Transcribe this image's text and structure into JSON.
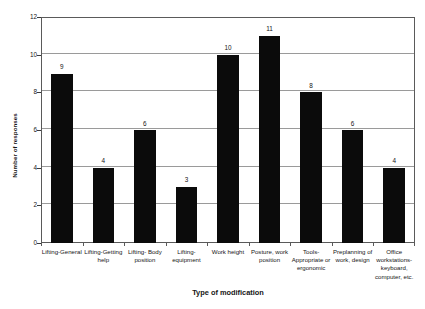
{
  "chart_data": {
    "type": "bar",
    "title": "",
    "xlabel": "Type of modification",
    "ylabel": "Number of responses",
    "ylim": [
      0,
      12
    ],
    "yticks": [
      0,
      2,
      4,
      6,
      8,
      10,
      12
    ],
    "grid": true,
    "legend": false,
    "bar_color": "#0b0b0b",
    "categories": [
      "Lifting-General",
      "Lifting-Getting help",
      "Lifting- Body position",
      "Lifting-equipment",
      "Work height",
      "Posture, work position",
      "Tools-Appropriate or ergonomic",
      "Preplanning of work, design",
      "Office workstations-keyboard, computer, etc."
    ],
    "values": [
      9,
      4,
      6,
      3,
      10,
      11,
      8,
      6,
      4
    ],
    "data_labels": [
      "9",
      "4",
      "6",
      "3",
      "10",
      "11",
      "8",
      "6",
      "4"
    ],
    "ytick_labels": [
      "0",
      "2",
      "4",
      "6",
      "8",
      "10",
      "12"
    ]
  }
}
